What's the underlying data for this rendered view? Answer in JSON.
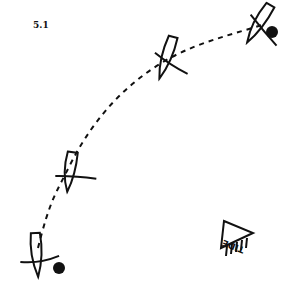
{
  "figure": {
    "label": "5.1",
    "path_style": "dashed",
    "boats": [
      {
        "id": 1,
        "x": 37,
        "y": 255,
        "heading_deg": -5,
        "mark": true
      },
      {
        "id": 2,
        "x": 70,
        "y": 170,
        "heading_deg": 8,
        "mark": false
      },
      {
        "id": 3,
        "x": 170,
        "y": 55,
        "heading_deg": 15,
        "mark": false
      },
      {
        "id": 4,
        "x": 262,
        "y": 22,
        "heading_deg": 30,
        "mark": true
      }
    ],
    "tide_indicator": {
      "label": "TIDE",
      "rotation_deg": 200
    },
    "colors": {
      "ink": "#111111",
      "background": "#ffffff"
    }
  }
}
